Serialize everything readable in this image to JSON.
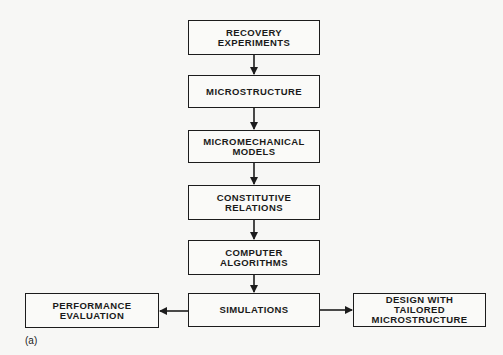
{
  "diagram": {
    "type": "flowchart",
    "nodes": [
      {
        "id": "recovery",
        "label": "RECOVERY\nEXPERIMENTS"
      },
      {
        "id": "microstructure",
        "label": "MICROSTRUCTURE"
      },
      {
        "id": "micromechanical",
        "label": "MICROMECHANICAL\nMODELS"
      },
      {
        "id": "constitutive",
        "label": "CONSTITUTIVE\nRELATIONS"
      },
      {
        "id": "algorithms",
        "label": "COMPUTER\nALGORITHMS"
      },
      {
        "id": "simulations",
        "label": "SIMULATIONS"
      },
      {
        "id": "performance",
        "label": "PERFORMANCE\nEVALUATION"
      },
      {
        "id": "design",
        "label": "DESIGN WITH\nTAILORED\nMICROSTRUCTURE"
      }
    ],
    "edges": [
      {
        "from": "recovery",
        "to": "microstructure"
      },
      {
        "from": "microstructure",
        "to": "micromechanical"
      },
      {
        "from": "micromechanical",
        "to": "constitutive"
      },
      {
        "from": "constitutive",
        "to": "algorithms"
      },
      {
        "from": "algorithms",
        "to": "simulations"
      },
      {
        "from": "simulations",
        "to": "performance"
      },
      {
        "from": "simulations",
        "to": "design"
      }
    ],
    "caption": "(a)"
  }
}
